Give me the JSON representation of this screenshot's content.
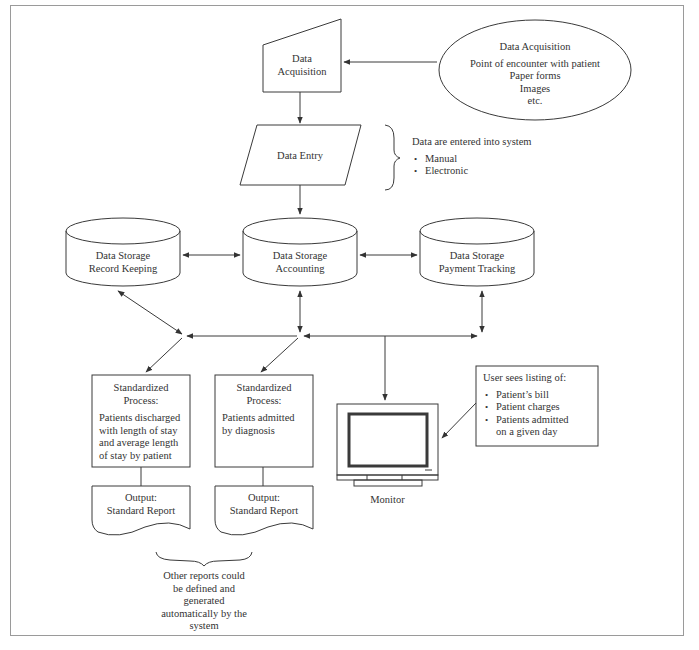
{
  "diagram": {
    "nodes": {
      "acquisition_source": {
        "shape": "ellipse",
        "title": "Data Acquisition",
        "lines": [
          "Point of encounter with patient",
          "Paper forms",
          "Images",
          "etc."
        ]
      },
      "data_acquisition": {
        "shape": "manual-input",
        "lines": [
          "Data",
          "Acquisition"
        ]
      },
      "data_entry": {
        "shape": "parallelogram",
        "label": "Data Entry"
      },
      "entry_note": {
        "title": "Data are entered into system",
        "bullets": [
          "Manual",
          "Electronic"
        ]
      },
      "storage_record": {
        "shape": "cylinder",
        "lines": [
          "Data Storage",
          "Record Keeping"
        ]
      },
      "storage_accounting": {
        "shape": "cylinder",
        "lines": [
          "Data Storage",
          "Accounting"
        ]
      },
      "storage_payment": {
        "shape": "cylinder",
        "lines": [
          "Data Storage",
          "Payment Tracking"
        ]
      },
      "process_1": {
        "shape": "rectangle",
        "title_lines": [
          "Standardized",
          "Process:"
        ],
        "body_lines": [
          "Patients discharged",
          "with length of stay",
          "and average length",
          "of stay by patient"
        ]
      },
      "process_2": {
        "shape": "rectangle",
        "title_lines": [
          "Standardized",
          "Process:"
        ],
        "body_lines": [
          "Patients admitted",
          "by diagnosis"
        ]
      },
      "output_1": {
        "shape": "document",
        "lines": [
          "Output:",
          "Standard Report"
        ]
      },
      "output_2": {
        "shape": "document",
        "lines": [
          "Output:",
          "Standard Report"
        ]
      },
      "reports_note": {
        "lines": [
          "Other reports could",
          "be defined and",
          "generated",
          "automatically by the",
          "system"
        ]
      },
      "monitor": {
        "shape": "monitor",
        "label": "Monitor"
      },
      "monitor_note": {
        "title": "User sees listing of:",
        "bullets": [
          "Patient’s bill",
          "Patient charges",
          "Patients admitted on a given day"
        ],
        "bullet_lines": [
          "Patient’s bill",
          "Patient charges",
          "Patients admitted",
          "on a given day"
        ]
      }
    },
    "edges": [
      {
        "from": "acquisition_source",
        "to": "data_acquisition",
        "type": "arrow"
      },
      {
        "from": "data_acquisition",
        "to": "data_entry",
        "type": "arrow"
      },
      {
        "from": "data_entry",
        "to": "storage_accounting",
        "type": "arrow"
      },
      {
        "from": "storage_record",
        "to": "storage_accounting",
        "type": "bidirectional"
      },
      {
        "from": "storage_accounting",
        "to": "storage_payment",
        "type": "bidirectional"
      },
      {
        "from": "storage_record",
        "to": "junction_left",
        "type": "bidirectional"
      },
      {
        "from": "storage_accounting",
        "to": "junction_center",
        "type": "bidirectional"
      },
      {
        "from": "storage_payment",
        "to": "junction_right",
        "type": "bidirectional"
      },
      {
        "from": "junction_center",
        "to": "junction_left",
        "type": "arrow"
      },
      {
        "from": "bus",
        "to": "junction_center",
        "type": "arrow"
      },
      {
        "from": "bus",
        "to": "junction_right",
        "type": "arrow"
      },
      {
        "from": "junction_left",
        "to": "process_1",
        "type": "arrow"
      },
      {
        "from": "junction_center",
        "to": "process_2",
        "type": "arrow"
      },
      {
        "from": "bus",
        "to": "monitor",
        "type": "arrow"
      },
      {
        "from": "monitor_note",
        "to": "monitor",
        "type": "arrow"
      },
      {
        "from": "process_1",
        "to": "output_1",
        "type": "line"
      },
      {
        "from": "process_2",
        "to": "output_2",
        "type": "line"
      }
    ],
    "colors": {
      "stroke": "#3a3a3a",
      "text": "#333333",
      "frame": "#9a9a9a",
      "background": "#ffffff"
    }
  }
}
